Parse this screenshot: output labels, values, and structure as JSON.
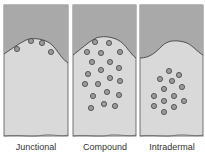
{
  "colors": {
    "epidermis": "#a9a9a9",
    "dermis": "#d9d9d9",
    "cell_fill": "#9a9a9a",
    "outline": "#444444"
  },
  "panels": [
    {
      "label": "Junctional"
    },
    {
      "label": "Compound"
    },
    {
      "label": "Intradermal"
    }
  ]
}
